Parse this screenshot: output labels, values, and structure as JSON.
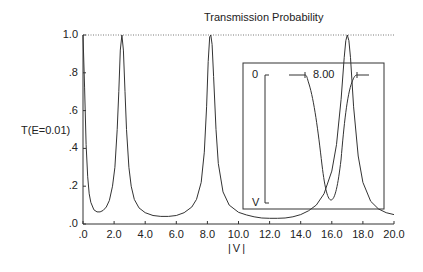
{
  "chart_data": {
    "type": "line",
    "title": "Transmission Probability",
    "xlabel": "|V|",
    "ylabel": "T(E=0.01)",
    "xlim": [
      0,
      20
    ],
    "ylim": [
      0,
      1
    ],
    "x_ticks": [
      ".0",
      "2.0",
      "4.0",
      "6.0",
      "8.0",
      "10.0",
      "12.0",
      "14.0",
      "16.0",
      "18.0",
      "20.0"
    ],
    "y_ticks": [
      ".0",
      ".2",
      ".4",
      ".6",
      ".8",
      "1.0"
    ],
    "grid": false,
    "reference_line": {
      "y": 1.0,
      "style": "dotted"
    },
    "series": [
      {
        "name": "T(E=0.01)",
        "x": [
          0.0,
          0.1,
          0.2,
          0.3,
          0.4,
          0.5,
          0.7,
          0.9,
          1.1,
          1.3,
          1.5,
          1.7,
          1.9,
          2.05,
          2.2,
          2.3,
          2.4,
          2.5,
          2.6,
          2.7,
          2.8,
          2.95,
          3.1,
          3.3,
          3.6,
          4.0,
          4.5,
          5.0,
          5.5,
          6.0,
          6.5,
          7.0,
          7.3,
          7.6,
          7.8,
          7.95,
          8.05,
          8.15,
          8.22,
          8.3,
          8.4,
          8.55,
          8.7,
          9.0,
          9.4,
          10.0,
          10.5,
          11.0,
          11.5,
          12.0,
          12.5,
          13.0,
          13.5,
          14.0,
          14.5,
          15.0,
          15.5,
          16.0,
          16.3,
          16.6,
          16.8,
          16.9,
          17.0,
          17.1,
          17.2,
          17.4,
          17.7,
          18.0,
          18.5,
          19.0,
          19.5,
          20.0
        ],
        "y": [
          1.0,
          0.72,
          0.42,
          0.25,
          0.16,
          0.115,
          0.075,
          0.064,
          0.064,
          0.072,
          0.09,
          0.125,
          0.2,
          0.3,
          0.5,
          0.7,
          0.92,
          1.0,
          0.92,
          0.7,
          0.5,
          0.3,
          0.2,
          0.13,
          0.085,
          0.06,
          0.045,
          0.04,
          0.04,
          0.045,
          0.06,
          0.09,
          0.13,
          0.22,
          0.38,
          0.62,
          0.86,
          0.99,
          1.0,
          0.95,
          0.78,
          0.5,
          0.32,
          0.17,
          0.1,
          0.062,
          0.048,
          0.038,
          0.032,
          0.03,
          0.03,
          0.032,
          0.038,
          0.05,
          0.07,
          0.1,
          0.16,
          0.28,
          0.42,
          0.66,
          0.88,
          0.97,
          1.0,
          0.97,
          0.88,
          0.62,
          0.36,
          0.22,
          0.12,
          0.08,
          0.06,
          0.05
        ]
      }
    ],
    "inset": {
      "labels": {
        "zero": "0",
        "v": "V",
        "value": "8.00"
      },
      "description": "Potential well profile sketch with depth V"
    }
  }
}
